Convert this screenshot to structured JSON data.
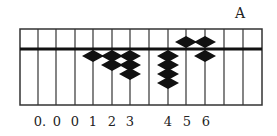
{
  "title": "A",
  "abacus": {
    "frame": {
      "left": 20,
      "right": 262,
      "top": 29,
      "beam": 49,
      "bottom": 105
    },
    "rods_x": [
      38,
      56,
      75,
      93,
      112,
      130,
      149,
      168,
      186,
      205,
      224,
      243
    ],
    "colors": {
      "ink": "#111111",
      "frame": "#333333"
    },
    "columns": [
      {
        "rod_x": 93,
        "upper_beads": 0,
        "lower_beads": 1
      },
      {
        "rod_x": 112,
        "upper_beads": 0,
        "lower_beads": 2
      },
      {
        "rod_x": 130,
        "upper_beads": 0,
        "lower_beads": 3
      },
      {
        "rod_x": 168,
        "upper_beads": 0,
        "lower_beads": 4
      },
      {
        "rod_x": 186,
        "upper_beads": 1,
        "lower_beads": 0
      },
      {
        "rod_x": 205,
        "upper_beads": 1,
        "lower_beads": 1
      }
    ]
  },
  "labels": [
    {
      "text": "0.",
      "x": 40
    },
    {
      "text": "0",
      "x": 57
    },
    {
      "text": "0",
      "x": 75
    },
    {
      "text": "1",
      "x": 93
    },
    {
      "text": "2",
      "x": 112
    },
    {
      "text": "3",
      "x": 130
    },
    {
      "text": "4",
      "x": 168
    },
    {
      "text": "5",
      "x": 187
    },
    {
      "text": "6",
      "x": 206
    }
  ]
}
